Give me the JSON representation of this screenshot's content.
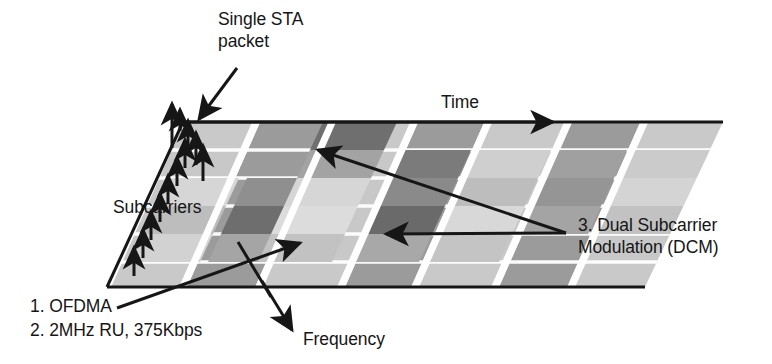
{
  "figure": {
    "type": "diagram",
    "background_color": "#ffffff",
    "ink_color": "#161616"
  },
  "axes": {
    "time": {
      "label": "Time",
      "direction": "right"
    },
    "frequency": {
      "label": "Frequency",
      "direction": "down-left"
    },
    "subcarriers": {
      "label": "Subcarriers",
      "direction": "up"
    }
  },
  "callouts": {
    "single_sta": {
      "label": "Single STA\npacket",
      "line1": "Single STA",
      "line2": "packet"
    },
    "dcm": {
      "label": "3. Dual Subcarrier\nModulation (DCM)",
      "line1": "3. Dual Subcarrier",
      "line2": "Modulation (DCM)"
    },
    "ofdma": {
      "label": "1. OFDMA"
    },
    "ru": {
      "label": "2. 2MHz RU, 375Kbps"
    }
  },
  "legend_list": [
    {
      "index": "1.",
      "text": "OFDMA"
    },
    {
      "index": "2.",
      "text": "2MHz RU, 375Kbps"
    },
    {
      "index": "3.",
      "text": "Dual Subcarrier Modulation (DCM)"
    }
  ],
  "colors": {
    "band_light": "#c9c9c9",
    "band_medium": "#9b9b9b",
    "cell_dark": "#6e6e6e",
    "cell_pale": "#d9d9d9",
    "separator": "#ffffff",
    "outline": "#161616"
  },
  "grid": {
    "band_count": 7,
    "subcarrier_arrow_count": 11,
    "row_count": 6,
    "bands": [
      {
        "id": 1,
        "shade": "light"
      },
      {
        "id": 2,
        "shade": "medium"
      },
      {
        "id": 3,
        "shade": "light"
      },
      {
        "id": 4,
        "shade": "medium"
      },
      {
        "id": 5,
        "shade": "light"
      },
      {
        "id": 6,
        "shade": "medium"
      },
      {
        "id": 7,
        "shade": "light"
      }
    ],
    "highlighted_cells": [
      {
        "band": 3,
        "row": 1,
        "shade": "dark",
        "note": "DCM"
      },
      {
        "band": 4,
        "row": 3,
        "shade": "dark",
        "note": "DCM"
      },
      {
        "band": 3,
        "row": 4,
        "shade": "dark",
        "note": "DCM"
      },
      {
        "band": 2,
        "row": 3,
        "shade": "dark",
        "note": "DCM"
      }
    ]
  }
}
